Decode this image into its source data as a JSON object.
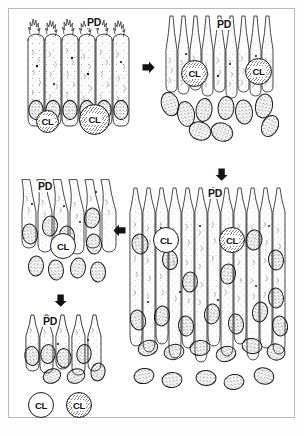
{
  "figure": {
    "border_color": "#b9b9b9",
    "ink_color": "#1a1a1a",
    "background_color": "#ffffff"
  },
  "panels": [
    {
      "id": "panel-top-left",
      "name": "stage-1-columnar-epithelium",
      "labels": {
        "pd": "PD",
        "cl_left": "CL",
        "cl_right": "CL"
      },
      "cell_count": 6,
      "has_apical_microvilli": true,
      "free_cells": 2
    },
    {
      "id": "panel-top-right",
      "name": "stage-2-detaching-cells",
      "labels": {
        "pd": "PD",
        "cl_left": "CL",
        "cl_right": "CL"
      },
      "cell_count": 9,
      "has_apical_microvilli": false,
      "free_cells": 0
    },
    {
      "id": "panel-mid-left",
      "name": "stage-3-degenerating-epithelium",
      "labels": {
        "pd": "PD",
        "cl_center": "CL"
      },
      "cell_count": 7,
      "free_cells": 0
    },
    {
      "id": "panel-bottom-left",
      "name": "stage-4-regenerating-epithelium",
      "labels": {
        "pd": "PD",
        "cl_left": "CL",
        "cl_right": "CL"
      },
      "cell_count": 5,
      "free_cells": 2
    },
    {
      "id": "panel-bottom-right",
      "name": "stage-5-mature-tall-epithelium",
      "labels": {
        "pd": "PD",
        "cl_left": "CL",
        "cl_right": "CL"
      },
      "cell_count": 12,
      "free_cells": 0
    }
  ],
  "arrows": [
    {
      "name": "arrow-stage1-to-stage2",
      "direction": "right",
      "x": 142,
      "y": 66
    },
    {
      "name": "arrow-stage2-to-stage5",
      "direction": "down",
      "x": 215,
      "y": 168
    },
    {
      "name": "arrow-stage5-to-stage3",
      "direction": "left",
      "x": 112,
      "y": 227
    },
    {
      "name": "arrow-stage3-to-stage4",
      "direction": "down",
      "x": 54,
      "y": 294
    }
  ],
  "legend_terms": {
    "PD": "PD",
    "CL": "CL"
  }
}
